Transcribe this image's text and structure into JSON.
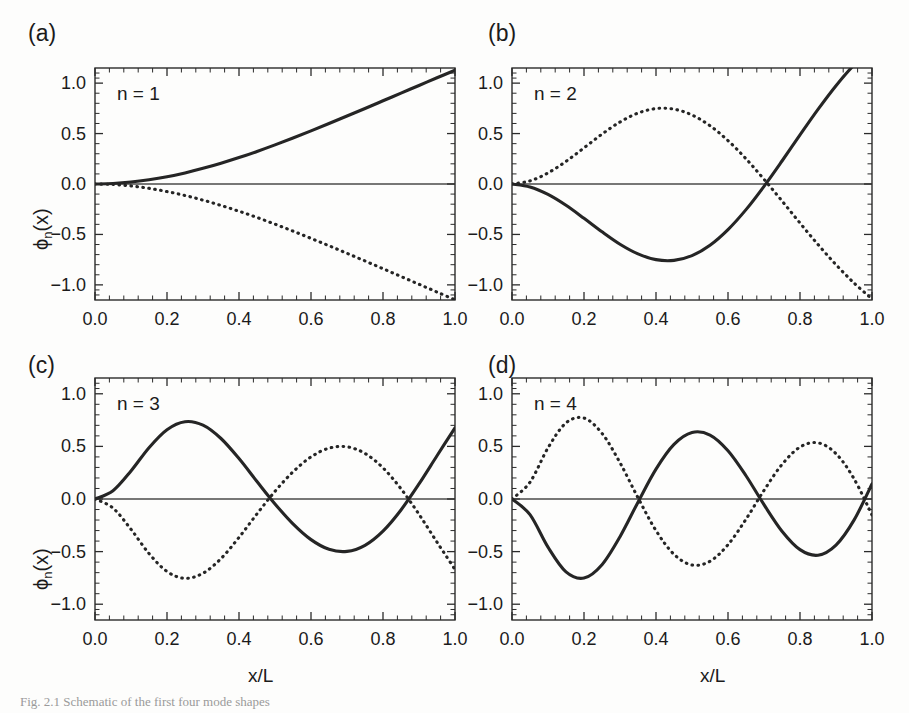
{
  "figure": {
    "caption": "Fig. 2.1  Schematic of the first four mode shapes",
    "xlabel": "x/L",
    "ylabel_main": "ϕ",
    "ylabel_sub": "n",
    "ylabel_tail": "(x)"
  },
  "chart_data": {
    "type": "line",
    "title": "",
    "xlabel": "x/L",
    "ylabel": "ϕn(x)",
    "xlim": [
      0.0,
      1.0
    ],
    "ylim": [
      -1.15,
      1.15
    ],
    "grid": false,
    "legend_position": "none",
    "xticks": [
      "0.0",
      "0.2",
      "0.4",
      "0.6",
      "0.8",
      "1.0"
    ],
    "xtick_values": [
      0.0,
      0.2,
      0.4,
      0.6,
      0.8,
      1.0
    ],
    "yticks": [
      "1.0",
      "0.5",
      "0.0",
      "-0.5",
      "-1.0"
    ],
    "ytick_values": [
      1.0,
      0.5,
      0.0,
      -0.5,
      -1.0
    ],
    "minor_ticks_per_interval": 4,
    "panels": [
      {
        "label": "(a)",
        "annotation": "n = 1",
        "n": 1,
        "beta": 1.8751,
        "series": [
          {
            "name": "clamped-free mode",
            "style": "solid",
            "x": [
              0.0,
              0.05,
              0.1,
              0.15,
              0.2,
              0.25,
              0.3,
              0.35,
              0.4,
              0.45,
              0.5,
              0.55,
              0.6,
              0.65,
              0.7,
              0.75,
              0.8,
              0.85,
              0.9,
              0.95,
              1.0
            ],
            "y": [
              0.0,
              0.005,
              0.019,
              0.042,
              0.072,
              0.11,
              0.155,
              0.206,
              0.262,
              0.323,
              0.388,
              0.456,
              0.527,
              0.6,
              0.674,
              0.749,
              0.825,
              0.901,
              0.977,
              1.053,
              1.128
            ]
          },
          {
            "name": "negative companion mode",
            "style": "dotted",
            "x": [
              0.0,
              0.05,
              0.1,
              0.15,
              0.2,
              0.25,
              0.3,
              0.35,
              0.4,
              0.45,
              0.5,
              0.55,
              0.6,
              0.65,
              0.7,
              0.75,
              0.8,
              0.85,
              0.9,
              0.95,
              1.0
            ],
            "y": [
              0.0,
              -0.005,
              -0.019,
              -0.043,
              -0.075,
              -0.114,
              -0.16,
              -0.213,
              -0.27,
              -0.332,
              -0.398,
              -0.467,
              -0.539,
              -0.612,
              -0.687,
              -0.763,
              -0.84,
              -0.917,
              -0.994,
              -1.071,
              -1.148
            ]
          }
        ]
      },
      {
        "label": "(b)",
        "annotation": "n = 2",
        "n": 2,
        "beta": 4.6941,
        "zero_crossing": 0.783,
        "series": [
          {
            "name": "clamped-free mode",
            "style": "solid",
            "x": [
              0.0,
              0.05,
              0.1,
              0.15,
              0.2,
              0.25,
              0.3,
              0.35,
              0.4,
              0.45,
              0.5,
              0.55,
              0.6,
              0.65,
              0.7,
              0.75,
              0.8,
              0.85,
              0.9,
              0.95,
              1.0
            ],
            "y": [
              0.0,
              -0.029,
              -0.103,
              -0.211,
              -0.34,
              -0.474,
              -0.597,
              -0.693,
              -0.75,
              -0.757,
              -0.71,
              -0.607,
              -0.452,
              -0.254,
              -0.023,
              0.228,
              0.487,
              0.74,
              0.975,
              1.18,
              1.345
            ]
          },
          {
            "name": "negative companion mode",
            "style": "dotted",
            "x": [
              0.0,
              0.05,
              0.1,
              0.15,
              0.2,
              0.25,
              0.3,
              0.35,
              0.4,
              0.45,
              0.5,
              0.55,
              0.6,
              0.65,
              0.7,
              0.75,
              0.8,
              0.85,
              0.9,
              0.95,
              1.0
            ],
            "y": [
              0.0,
              0.031,
              0.11,
              0.224,
              0.358,
              0.494,
              0.615,
              0.703,
              0.748,
              0.742,
              0.684,
              0.578,
              0.43,
              0.25,
              0.047,
              -0.168,
              -0.387,
              -0.6,
              -0.8,
              -0.981,
              -1.14
            ]
          }
        ]
      },
      {
        "label": "(c)",
        "annotation": "n = 3",
        "n": 3,
        "beta": 7.8548,
        "zero_crossings": [
          0.504,
          0.868
        ],
        "series": [
          {
            "name": "clamped-free mode",
            "style": "solid",
            "x": [
              0.0,
              0.05,
              0.1,
              0.15,
              0.2,
              0.25,
              0.3,
              0.35,
              0.4,
              0.45,
              0.5,
              0.55,
              0.6,
              0.65,
              0.7,
              0.75,
              0.8,
              0.85,
              0.9,
              0.95,
              1.0
            ],
            "y": [
              0.0,
              0.079,
              0.267,
              0.488,
              0.659,
              0.735,
              0.702,
              0.575,
              0.384,
              0.166,
              -0.047,
              -0.236,
              -0.386,
              -0.478,
              -0.498,
              -0.44,
              -0.305,
              -0.104,
              0.143,
              0.411,
              0.677
            ]
          },
          {
            "name": "negative companion mode",
            "style": "dotted",
            "x": [
              0.0,
              0.05,
              0.1,
              0.15,
              0.2,
              0.25,
              0.3,
              0.35,
              0.4,
              0.45,
              0.5,
              0.55,
              0.6,
              0.65,
              0.7,
              0.75,
              0.8,
              0.85,
              0.9,
              0.95,
              1.0
            ],
            "y": [
              0.0,
              -0.086,
              -0.288,
              -0.518,
              -0.689,
              -0.754,
              -0.706,
              -0.566,
              -0.365,
              -0.141,
              0.073,
              0.258,
              0.4,
              0.483,
              0.496,
              0.433,
              0.296,
              0.097,
              -0.146,
              -0.41,
              -0.67
            ]
          }
        ]
      },
      {
        "label": "(d)",
        "annotation": "n = 4",
        "n": 4,
        "beta": 10.9955,
        "zero_crossings": [
          0.358,
          0.644,
          0.906
        ],
        "series": [
          {
            "name": "clamped-free mode",
            "style": "solid",
            "x": [
              0.0,
              0.05,
              0.1,
              0.15,
              0.2,
              0.25,
              0.3,
              0.35,
              0.4,
              0.45,
              0.5,
              0.55,
              0.6,
              0.65,
              0.7,
              0.75,
              0.8,
              0.85,
              0.9,
              0.95,
              1.0
            ],
            "y": [
              0.0,
              -0.149,
              -0.458,
              -0.693,
              -0.751,
              -0.624,
              -0.358,
              -0.03,
              0.284,
              0.519,
              0.632,
              0.608,
              0.459,
              0.221,
              -0.054,
              -0.306,
              -0.481,
              -0.534,
              -0.438,
              -0.201,
              0.143
            ]
          },
          {
            "name": "negative companion mode",
            "style": "dotted",
            "x": [
              0.0,
              0.05,
              0.1,
              0.15,
              0.2,
              0.25,
              0.3,
              0.35,
              0.4,
              0.45,
              0.5,
              0.55,
              0.6,
              0.65,
              0.7,
              0.75,
              0.8,
              0.85,
              0.9,
              0.95,
              1.0
            ],
            "y": [
              0.0,
              0.16,
              0.486,
              0.723,
              0.769,
              0.624,
              0.345,
              0.012,
              -0.3,
              -0.526,
              -0.627,
              -0.592,
              -0.434,
              -0.192,
              0.082,
              0.328,
              0.493,
              0.534,
              0.431,
              0.193,
              -0.152
            ]
          }
        ]
      }
    ]
  }
}
